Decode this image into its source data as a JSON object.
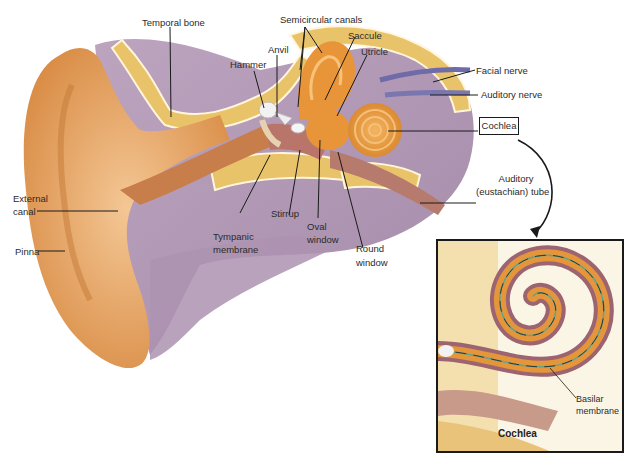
{
  "figure": {
    "labels": {
      "temporal_bone": "Temporal bone",
      "semicircular_canals": "Semicircular canals",
      "anvil": "Anvil",
      "hammer": "Hammer",
      "saccule": "Saccule",
      "utricle": "Utricle",
      "facial_nerve": "Facial nerve",
      "auditory_nerve": "Auditory nerve",
      "cochlea": "Cochlea",
      "auditory_tube_1": "Auditory",
      "auditory_tube_2": "(eustachian) tube",
      "external_canal_1": "External",
      "external_canal_2": "canal",
      "pinna": "Pinna",
      "stirrup": "Stirrup",
      "tympanic_1": "Tympanic",
      "tympanic_2": "membrane",
      "oval_1": "Oval",
      "oval_2": "window",
      "round_1": "Round",
      "round_2": "window"
    },
    "inset": {
      "title": "Cochlea",
      "basilar_1": "Basilar",
      "basilar_2": "membrane"
    },
    "colors": {
      "skin": "#e9ab6a",
      "tissue": "#a58aa8",
      "bone": "#e8c36a",
      "cochlea": "#e59a3b",
      "nerve": "#6f6aa8",
      "line": "#1a1a1a"
    }
  }
}
